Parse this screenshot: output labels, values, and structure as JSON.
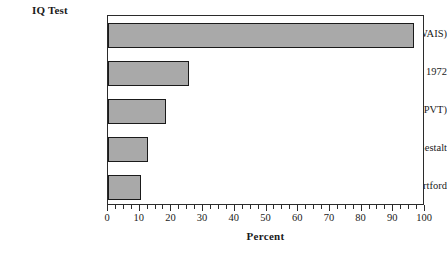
{
  "chart_data": {
    "type": "bar",
    "orientation": "horizontal",
    "title": "",
    "category_axis_title": "IQ Test",
    "xlabel": "Percent",
    "ylabel": "",
    "categories": [
      "WAIS-R (or WAIS)",
      "Stanford-Binet 1972",
      "PPVT-R (or PPVT)",
      "Bender-Gestalt",
      "Shipley-Hartford"
    ],
    "values": [
      96.5,
      25.5,
      18.3,
      12.6,
      10.5
    ],
    "xlim": [
      0,
      100
    ],
    "xticks": [
      0,
      10,
      20,
      30,
      40,
      50,
      60,
      70,
      80,
      90,
      100
    ],
    "xtick_labels": [
      "0",
      "10",
      "20",
      "30",
      "40",
      "50",
      "60",
      "70",
      "80",
      "90",
      "100"
    ],
    "minor_tick_step": 2.5,
    "grid": false,
    "legend": "none",
    "bar_fill_color": "#a9a9a9",
    "bar_edge_color": "#1a1a1a",
    "frame_color": "#2b2b2b",
    "background_color": "#ffffff"
  }
}
